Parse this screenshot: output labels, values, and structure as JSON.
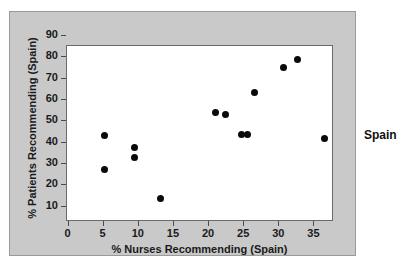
{
  "chart_data": {
    "type": "scatter",
    "title": "",
    "xlabel": "% Nurses Recommending (Spain)",
    "ylabel": "% Patients Recommending (Spain)",
    "series_label": "Spain",
    "xlim": [
      -1.5,
      36.5
    ],
    "ylim": [
      8.0,
      90.5
    ],
    "xticks": [
      0,
      5,
      10,
      15,
      20,
      25,
      30,
      35
    ],
    "yticks": [
      10,
      20,
      30,
      40,
      50,
      60,
      70,
      80,
      90
    ],
    "grid": false,
    "legend_position": "right-outside",
    "marker": "filled-circle",
    "marker_color": "#0a0a0a",
    "panel_color": "#c9c9c9",
    "plot_background": "#ffffff",
    "points": [
      {
        "x": 3.9,
        "y": 48.5
      },
      {
        "x": 3.8,
        "y": 32.5
      },
      {
        "x": 8.1,
        "y": 43.0
      },
      {
        "x": 8.1,
        "y": 38.3
      },
      {
        "x": 11.8,
        "y": 19.0
      },
      {
        "x": 19.7,
        "y": 59.3
      },
      {
        "x": 21.0,
        "y": 58.5
      },
      {
        "x": 23.4,
        "y": 49.0
      },
      {
        "x": 24.2,
        "y": 49.0
      },
      {
        "x": 25.2,
        "y": 68.5
      },
      {
        "x": 29.3,
        "y": 80.5
      },
      {
        "x": 31.3,
        "y": 84.0
      },
      {
        "x": 35.1,
        "y": 47.0
      }
    ]
  }
}
